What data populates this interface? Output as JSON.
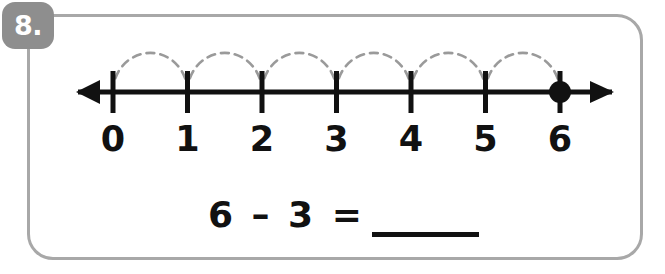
{
  "problem": {
    "number_label": "8.",
    "equation": "6 – 3 =",
    "answer_value": "",
    "answer_blank_present": true
  },
  "number_line": {
    "min": 0,
    "max": 6,
    "tick_labels": [
      "0",
      "1",
      "2",
      "3",
      "4",
      "5",
      "6"
    ],
    "left_arrow": true,
    "right_arrow": true,
    "marker_position": 6,
    "marker_style": "filled-dot",
    "hops": [
      {
        "from": 0,
        "to": 1
      },
      {
        "from": 1,
        "to": 2
      },
      {
        "from": 2,
        "to": 3
      },
      {
        "from": 3,
        "to": 4
      },
      {
        "from": 4,
        "to": 5
      },
      {
        "from": 5,
        "to": 6
      }
    ],
    "hop_style": "dashed-arc"
  },
  "colors": {
    "ink": "#111111",
    "border": "#a8a8a8",
    "badge_bg": "#8e8e8e",
    "badge_text": "#ffffff",
    "hop_arc": "#9a9a9a"
  }
}
